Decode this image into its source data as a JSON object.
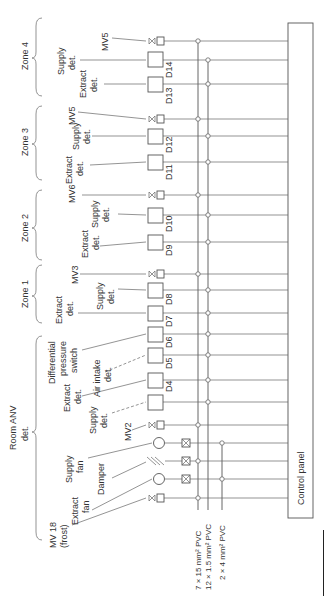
{
  "diagram": {
    "control_panel": {
      "label": "Control panel"
    },
    "cables": [
      {
        "id": "c1",
        "label": "7 × 15 mm² PVC",
        "x": 198
      },
      {
        "id": "c2",
        "label": "12 × 1.5 mm² PVC",
        "x": 208
      },
      {
        "id": "c3",
        "label": "2 × 4 mm² PVC",
        "x": 222
      }
    ],
    "groups": [
      {
        "label": "Zone 4"
      },
      {
        "label": "Zone 3"
      },
      {
        "label": "Zone 2"
      },
      {
        "label": "Zone 1"
      },
      {
        "label_line1": "Room ANV",
        "label_line2": "det."
      }
    ],
    "devices": [
      {
        "label": "MV5",
        "type": "valve",
        "y": 41
      },
      {
        "label_line1": "Supply",
        "label_line2": "det.",
        "type": "box",
        "y": 60,
        "tag": "D14"
      },
      {
        "label_line1": "Extract",
        "label_line2": "det.",
        "type": "box",
        "y": 84,
        "tag": "D13"
      },
      {
        "label": "MV5",
        "type": "valve",
        "y": 119
      },
      {
        "label_line1": "Supply",
        "label_line2": "det.",
        "type": "box",
        "y": 136,
        "tag": "D12"
      },
      {
        "label_line1": "Extract",
        "label_line2": "det.",
        "type": "box",
        "y": 162,
        "tag": "D11"
      },
      {
        "label": "MV6",
        "type": "valve",
        "y": 195
      },
      {
        "label_line1": "Supply",
        "label_line2": "det.",
        "type": "box",
        "y": 215,
        "tag": "D10"
      },
      {
        "label_line1": "Extract",
        "label_line2": "det.",
        "type": "box",
        "y": 242,
        "tag": "D9"
      },
      {
        "label": "MV3",
        "type": "valve",
        "y": 274
      },
      {
        "label_line1": "Supply",
        "label_line2": "det.",
        "type": "box",
        "y": 290,
        "tag": "D8"
      },
      {
        "label_line1": "Extract",
        "label_line2": "det.",
        "type": "box",
        "y": 313,
        "tag": "D7"
      },
      {
        "label_line1": "Differential",
        "label_line2": "pressure",
        "label_line3": "switch",
        "type": "box",
        "y": 334,
        "tag": "D6"
      },
      {
        "label_line1": "Air intake",
        "label_line2": "det.",
        "type": "box",
        "y": 355,
        "tag": "D5"
      },
      {
        "label_line1": "Extract",
        "label_line2": "det.",
        "type": "box",
        "y": 380,
        "tag": "D4"
      },
      {
        "label_line1": "Supply",
        "label_line2": "det.",
        "type": "box",
        "y": 402
      },
      {
        "label": "MV2",
        "type": "valve",
        "y": 425
      },
      {
        "label_line1": "Supply",
        "label_line2": "fan",
        "type": "fan",
        "y": 443
      },
      {
        "label": "Damper",
        "type": "damper",
        "y": 461
      },
      {
        "label_line1": "Extract",
        "label_line2": "fan",
        "type": "fan",
        "y": 479
      },
      {
        "label_line1": "MV 18",
        "label_line2": "(frost)",
        "type": "valve",
        "y": 498
      }
    ]
  }
}
